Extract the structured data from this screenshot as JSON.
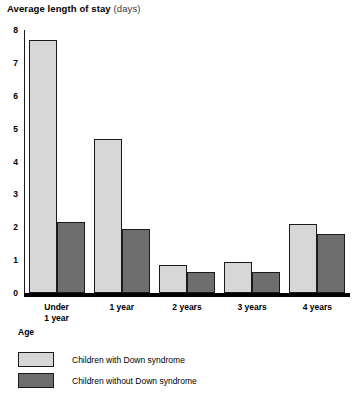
{
  "chart_data": {
    "type": "bar",
    "title": "Average length of stay (days)",
    "title_main": "Average length of stay",
    "title_unit": "(days)",
    "xlabel": "Age",
    "ylabel": "",
    "ylim": [
      0,
      8
    ],
    "yticks": [
      0,
      1,
      2,
      3,
      4,
      5,
      6,
      7,
      8
    ],
    "ytick_labels": [
      "0",
      "1",
      "2",
      "3",
      "4",
      "5",
      "6",
      "7",
      "8"
    ],
    "grid": false,
    "legend_position": "bottom-left",
    "categories": [
      "Under\n1 year",
      "1 year",
      "2 years",
      "3 years",
      "4 years"
    ],
    "category_labels": [
      "Under 1 year",
      "1 year",
      "2 years",
      "3 years",
      "4 years"
    ],
    "series": [
      {
        "name": "Children with Down syndrome",
        "color": "#d7d7d7",
        "values": [
          7.7,
          4.7,
          0.85,
          0.95,
          2.1
        ]
      },
      {
        "name": "Children without Down syndrome",
        "color": "#6e6e6e",
        "values": [
          2.15,
          1.95,
          0.65,
          0.65,
          1.8
        ]
      }
    ]
  },
  "legend": {
    "items": [
      {
        "label": "Children with Down syndrome",
        "color": "#d7d7d7"
      },
      {
        "label": "Children without Down syndrome",
        "color": "#6e6e6e"
      }
    ]
  },
  "axis": {
    "x_title": "Age"
  },
  "colors": {
    "light_bar": "#d7d7d7",
    "dark_bar": "#6e6e6e",
    "axis": "#000000",
    "text": "#000000",
    "background": "#ffffff"
  }
}
